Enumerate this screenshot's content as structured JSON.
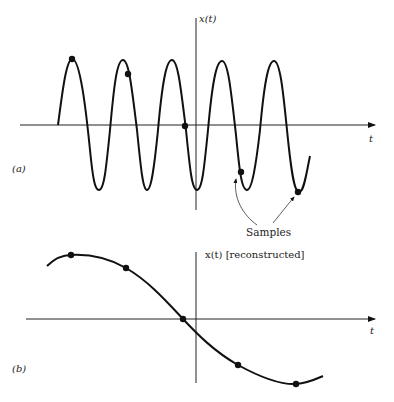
{
  "figure": {
    "panel_a": {
      "label": "(a)",
      "y_axis_label": "x(t)",
      "x_axis_label": "t",
      "annotation": "Samples",
      "description": "High-frequency sinusoid x(t) with 5 sample points taken at intervals longer than its period (undersampling)"
    },
    "panel_b": {
      "label": "(b)",
      "y_axis_label": "x(t) [reconstructed]",
      "x_axis_label": "t",
      "description": "Low-frequency reconstructed sinusoid passing through the same 5 sample points (aliasing)"
    },
    "colors": {
      "line": "#111111",
      "background": "#ffffff"
    }
  }
}
